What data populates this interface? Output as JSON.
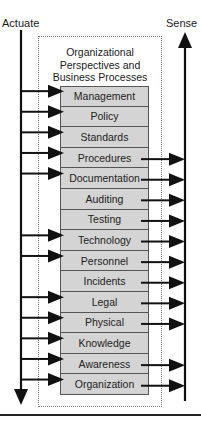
{
  "diagram": {
    "actuate_label": "Actuate",
    "sense_label": "Sense",
    "frame_title": [
      "Organizational",
      "Perspectives and",
      "Business Processes"
    ],
    "layers": [
      {
        "label": "Management",
        "actuate": true,
        "sense": false
      },
      {
        "label": "Policy",
        "actuate": true,
        "sense": false
      },
      {
        "label": "Standards",
        "actuate": true,
        "sense": false
      },
      {
        "label": "Procedures",
        "actuate": true,
        "sense": true
      },
      {
        "label": "Documentation",
        "actuate": true,
        "sense": true
      },
      {
        "label": "Auditing",
        "actuate": false,
        "sense": true
      },
      {
        "label": "Testing",
        "actuate": false,
        "sense": true
      },
      {
        "label": "Technology",
        "actuate": true,
        "sense": true
      },
      {
        "label": "Personnel",
        "actuate": true,
        "sense": true
      },
      {
        "label": "Incidents",
        "actuate": false,
        "sense": true
      },
      {
        "label": "Legal",
        "actuate": true,
        "sense": true
      },
      {
        "label": "Physical",
        "actuate": true,
        "sense": true
      },
      {
        "label": "Knowledge",
        "actuate": true,
        "sense": false
      },
      {
        "label": "Awareness",
        "actuate": true,
        "sense": true
      },
      {
        "label": "Organization",
        "actuate": true,
        "sense": true
      }
    ],
    "colors": {
      "layer_fill": "#d4d4d4",
      "layer_border": "#555555",
      "arrow": "#111111",
      "frame_border": "#777777"
    }
  }
}
